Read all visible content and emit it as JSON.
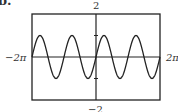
{
  "figure": {
    "part_label": "b.",
    "y_max_label": "2",
    "y_min_label": "−2",
    "x_min_label": "−2π",
    "x_max_label": "2π"
  },
  "chart_data": {
    "type": "line",
    "title": "",
    "function": "y = sin(2x)",
    "xlabel": "",
    "ylabel": "",
    "xlim": [
      -6.2832,
      6.2832
    ],
    "ylim": [
      -2,
      2
    ],
    "x_tick_labels": [
      "−2π",
      "2π"
    ],
    "y_tick_labels": [
      "2",
      "−2"
    ],
    "y_ticks": [
      -1,
      1
    ],
    "grid": false,
    "legend": null,
    "series": [
      {
        "name": "sin(2x)",
        "amplitude": 1,
        "period": 3.1416,
        "x": [
          -6.2832,
          -5.4978,
          -4.7124,
          -3.927,
          -3.1416,
          -2.3562,
          -1.5708,
          -0.7854,
          0,
          0.7854,
          1.5708,
          2.3562,
          3.1416,
          3.927,
          4.7124,
          5.4978,
          6.2832
        ],
        "values": [
          0,
          1,
          0,
          -1,
          0,
          1,
          0,
          -1,
          0,
          1,
          0,
          -1,
          0,
          1,
          0,
          -1,
          0
        ]
      }
    ]
  }
}
